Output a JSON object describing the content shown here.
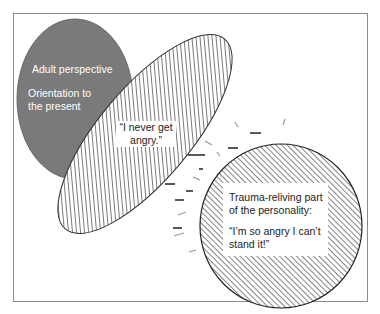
{
  "caption": "Figure: parts of the personality",
  "colors": {
    "frame": "#8c8c8c",
    "adult_fill": "#7a7a7a",
    "outline": "#333333",
    "hatch": "#333333",
    "dash_dark": "#222222",
    "dash_light": "#9a9a9a"
  },
  "adult_part": {
    "line1": "Adult perspective",
    "line2a": "Orientation to",
    "line2b": "the present"
  },
  "avoidant_part": {
    "line1": "“I never get",
    "line2": "angry.”"
  },
  "trauma_part": {
    "title1": "Trauma-reliving part",
    "title2": "of the personality:",
    "quote1": "“I’m so angry I can’t",
    "quote2": "stand it!”"
  }
}
